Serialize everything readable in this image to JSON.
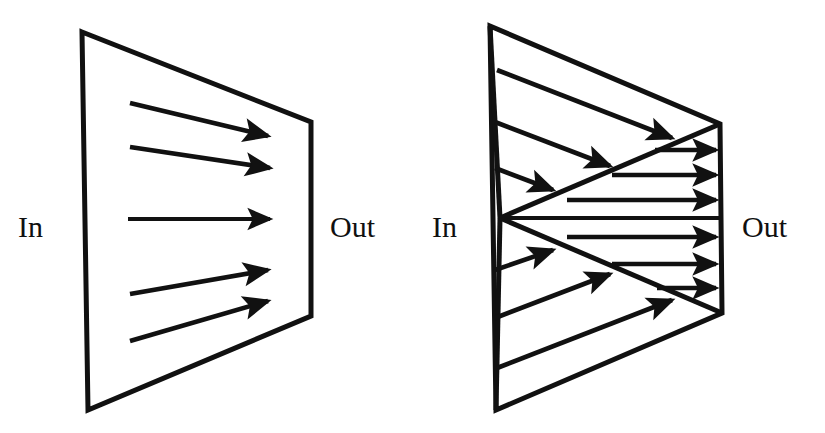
{
  "figure": {
    "background_color": "#ffffff",
    "ink_color": "#111111",
    "panels": [
      {
        "id": "left-panel",
        "name": "parallel-beam-panel",
        "description": "Trapezoid conduit with five parallel rays passing straight from the In face to the Out face",
        "in_label": "In",
        "out_label": "Out",
        "ray_count": 5,
        "boundary": {
          "type": "quadrilateral",
          "points": "82,32 311,122 311,316 88,410"
        },
        "in_label_pos": {
          "x": 18,
          "y": 230
        },
        "out_label_pos": {
          "x": 330,
          "y": 230
        },
        "rays": [
          {
            "x1": 130,
            "y1": 103,
            "x2": 268,
            "y2": 136
          },
          {
            "x1": 130,
            "y1": 147,
            "x2": 270,
            "y2": 168
          },
          {
            "x1": 128,
            "y1": 219,
            "x2": 270,
            "y2": 219
          },
          {
            "x1": 130,
            "y1": 294,
            "x2": 268,
            "y2": 270
          },
          {
            "x1": 130,
            "y1": 341,
            "x2": 268,
            "y2": 301
          }
        ]
      },
      {
        "id": "right-panel",
        "name": "focusing-beam-panel",
        "description": "Trapezoid conduit with a bowtie crossing: six incoming rays converge to a focal point on the In face, then six horizontal rays exit through the Out face",
        "in_label": "In",
        "out_label": "Out",
        "converging_ray_count": 6,
        "output_ray_count": 6,
        "boundary": {
          "type": "quadrilateral",
          "points": "490,26 720,124 722,313 496,410"
        },
        "focal_point": {
          "x": 500,
          "y": 218
        },
        "bowtie": {
          "upper_left_to_focus": "490,26 500,218",
          "lower_left_to_focus": "496,410 500,218",
          "focus_to_upper_right": "500,218 720,124",
          "focus_to_lower_right": "500,218 722,313",
          "axis": "500,218 722,218"
        },
        "in_label_pos": {
          "x": 432,
          "y": 230
        },
        "out_label_pos": {
          "x": 742,
          "y": 230
        },
        "converging_rays": [
          {
            "x1": 497,
            "y1": 70,
            "x2": 672,
            "y2": 138
          },
          {
            "x1": 495,
            "y1": 122,
            "x2": 610,
            "y2": 166
          },
          {
            "x1": 495,
            "y1": 168,
            "x2": 553,
            "y2": 190
          },
          {
            "x1": 495,
            "y1": 270,
            "x2": 553,
            "y2": 250
          },
          {
            "x1": 495,
            "y1": 318,
            "x2": 610,
            "y2": 274
          },
          {
            "x1": 497,
            "y1": 368,
            "x2": 672,
            "y2": 300
          }
        ],
        "output_rays": [
          {
            "x1": 655,
            "y1": 150,
            "x2": 716,
            "y2": 150
          },
          {
            "x1": 612,
            "y1": 175,
            "x2": 716,
            "y2": 175
          },
          {
            "x1": 567,
            "y1": 200,
            "x2": 716,
            "y2": 200
          },
          {
            "x1": 567,
            "y1": 237,
            "x2": 716,
            "y2": 237
          },
          {
            "x1": 612,
            "y1": 264,
            "x2": 716,
            "y2": 264
          },
          {
            "x1": 657,
            "y1": 288,
            "x2": 716,
            "y2": 288
          }
        ]
      }
    ]
  }
}
